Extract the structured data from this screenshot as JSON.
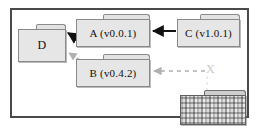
{
  "diagram": {
    "frame_border_color": "#4a4a4a",
    "background": "#ffffff",
    "node_fill": "#e6e6e6",
    "node_border": "#8a8a8a",
    "solid_edge_color": "#111111",
    "dashed_edge_color": "#b0b0b0"
  },
  "nodes": [
    {
      "id": "d",
      "label": "D",
      "shape": "package"
    },
    {
      "id": "a",
      "label": "A (v0.0.1)",
      "shape": "package"
    },
    {
      "id": "b",
      "label": "B (v0.4.2)",
      "shape": "package"
    },
    {
      "id": "c",
      "label": "C (v1.0.1)",
      "shape": "package"
    },
    {
      "id": "x",
      "label": "",
      "shape": "package",
      "state": "redacted"
    }
  ],
  "marker": {
    "label": "X"
  },
  "edges": [
    {
      "from": "c",
      "to": "a",
      "style": "solid",
      "arrow": "left"
    },
    {
      "from": "a",
      "to": "d",
      "style": "solid",
      "arrow": "left"
    },
    {
      "from": "b",
      "to": "d",
      "style": "dashed",
      "arrow": "left"
    },
    {
      "from": "x",
      "to": "b",
      "style": "dashed",
      "arrow": "left"
    }
  ]
}
